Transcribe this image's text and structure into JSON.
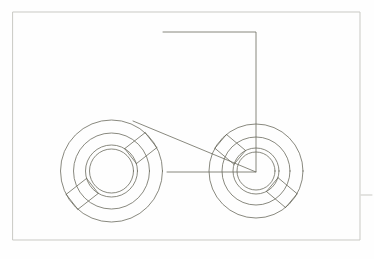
{
  "document": {
    "title": "Wheeled Vehicle Line Drawing",
    "canvas": {
      "width": 374,
      "height": 259,
      "background": "#fefefe"
    }
  },
  "style": {
    "stroke_color": "#6b6b5e",
    "frame_stroke_color": "#c9c9c4",
    "stroke_width": 0.8,
    "frame_stroke_width": 1.0,
    "fill": "none"
  },
  "frame": {
    "label": "page-border",
    "x": 13,
    "y": 12,
    "width": 347,
    "height": 228
  },
  "tick_mark": {
    "label": "right-margin-tick",
    "x1": 361,
    "y1": 195,
    "x2": 372,
    "y2": 195
  },
  "shapes": {
    "body": {
      "label": "trapezoid-body",
      "points": "163,32 256,32 256,172 133,121",
      "top_left": {
        "x": 163,
        "y": 32
      },
      "top_right": {
        "x": 256,
        "y": 32
      },
      "bottom_right": {
        "x": 256,
        "y": 172
      },
      "bottom_left": {
        "x": 133,
        "y": 121
      }
    },
    "axle": {
      "label": "horizontal-axle-line",
      "x1": 167,
      "y1": 172,
      "x2": 256,
      "y2": 172
    },
    "left_wheel": {
      "label": "left-wheel",
      "center_x": 111.5,
      "center_y": 171,
      "radii": [
        51,
        38,
        26,
        22
      ],
      "band": {
        "label": "left-wheel-spoke-band",
        "angle_deg": -38,
        "half_width": 9.5,
        "inner_stop_radius": 26,
        "outer_stop_radius": 51
      }
    },
    "right_wheel": {
      "label": "right-wheel",
      "center_x": 256,
      "center_y": 171,
      "radii": [
        47,
        34,
        23,
        19
      ],
      "band": {
        "label": "right-wheel-spoke-band",
        "angle_deg": 40,
        "half_width": 9.0,
        "inner_stop_radius": 23,
        "outer_stop_radius": 47
      }
    }
  }
}
